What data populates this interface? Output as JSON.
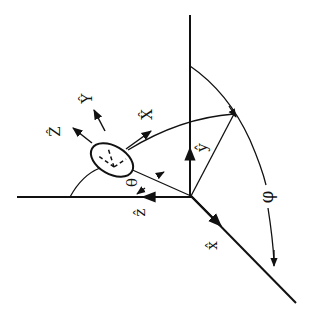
{
  "diagram": {
    "type": "spherical-coordinate-geometry",
    "colors": {
      "line": "#111111",
      "background": "#ffffff"
    },
    "axes": [
      {
        "id": "x",
        "label": "x̂"
      },
      {
        "id": "y",
        "label": "ŷ"
      },
      {
        "id": "z",
        "label": "ẑ"
      }
    ],
    "body_axes": [
      {
        "id": "X",
        "label": "X̂"
      },
      {
        "id": "Y",
        "label": "Ŷ"
      },
      {
        "id": "Z",
        "label": "Ẑ"
      }
    ],
    "angles": [
      {
        "id": "theta",
        "label": "θ"
      },
      {
        "id": "phi",
        "label": "φ"
      }
    ]
  }
}
